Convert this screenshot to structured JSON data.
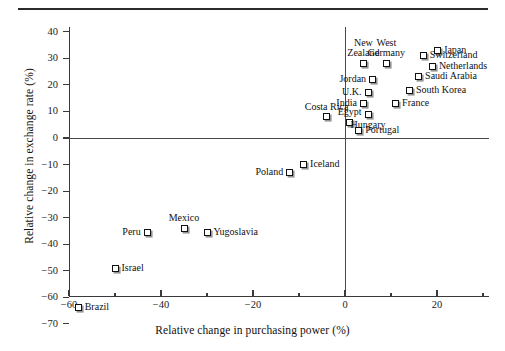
{
  "figure": {
    "title": "",
    "xtitle": "Relative change in purchasing power (%)",
    "ytitle": "Relative change in exchange rate (%)"
  },
  "axes": {
    "x_ticks": [
      "-60",
      "-40",
      "-20",
      "0",
      "20"
    ],
    "x_tick_values": [
      -60,
      -40,
      -20,
      0,
      20
    ],
    "x_minor_values": [
      -50,
      -30,
      -10,
      10,
      30
    ],
    "y_ticks": [
      "40",
      "30",
      "20",
      "10",
      "0",
      "-10",
      "-20",
      "-30",
      "-40",
      "-50",
      "-60",
      "-70"
    ],
    "y_tick_values": [
      40,
      30,
      20,
      10,
      0,
      -10,
      -20,
      -30,
      -40,
      -50,
      -60,
      -70
    ]
  },
  "chart_data": {
    "type": "scatter",
    "title": "",
    "xlabel": "Relative change in purchasing power (%)",
    "ylabel": "Relative change in exchange rate (%)",
    "xlim": [
      -62,
      29
    ],
    "ylim": [
      -71,
      44
    ],
    "grid": false,
    "legend": "none",
    "reference_lines": {
      "x": 0,
      "y": 0
    },
    "points": [
      {
        "label": "Brazil",
        "x": -58,
        "y": -64,
        "label_pos": "right"
      },
      {
        "label": "Israel",
        "x": -50,
        "y": -49,
        "label_pos": "right"
      },
      {
        "label": "Peru",
        "x": -43,
        "y": -35.5,
        "label_pos": "left"
      },
      {
        "label": "Mexico",
        "x": -35,
        "y": -34,
        "label_pos": "above"
      },
      {
        "label": "Yugoslavia",
        "x": -30,
        "y": -35.5,
        "label_pos": "right"
      },
      {
        "label": "Poland",
        "x": -12,
        "y": -13,
        "label_pos": "left"
      },
      {
        "label": "Iceland",
        "x": -9,
        "y": -10,
        "label_pos": "right"
      },
      {
        "label": "Costa Rica",
        "x": -4,
        "y": 8,
        "label_pos": "above"
      },
      {
        "label": "Egypt",
        "x": 1,
        "y": 6,
        "label_pos": "above"
      },
      {
        "label": "Portugal",
        "x": 3,
        "y": 3,
        "label_pos": "right"
      },
      {
        "label": "Hungary",
        "x": 5,
        "y": 9,
        "label_pos": "below"
      },
      {
        "label": "India",
        "x": 4,
        "y": 13,
        "label_pos": "left"
      },
      {
        "label": "U.K.",
        "x": 5,
        "y": 17,
        "label_pos": "left"
      },
      {
        "label": "Jordan",
        "x": 6,
        "y": 22,
        "label_pos": "left"
      },
      {
        "label": "New Zealand",
        "x": 4,
        "y": 28,
        "label_pos": "above2"
      },
      {
        "label": "West Germany",
        "x": 9,
        "y": 28,
        "label_pos": "above2"
      },
      {
        "label": "Japan",
        "x": 20,
        "y": 33,
        "label_pos": "right"
      },
      {
        "label": "Switzerland",
        "x": 17,
        "y": 31,
        "label_pos": "right"
      },
      {
        "label": "Netherlands",
        "x": 19,
        "y": 27,
        "label_pos": "right"
      },
      {
        "label": "Saudi Arabia",
        "x": 16,
        "y": 23,
        "label_pos": "right"
      },
      {
        "label": "South Korea",
        "x": 14,
        "y": 18,
        "label_pos": "right"
      },
      {
        "label": "France",
        "x": 11,
        "y": 13,
        "label_pos": "right"
      }
    ]
  }
}
